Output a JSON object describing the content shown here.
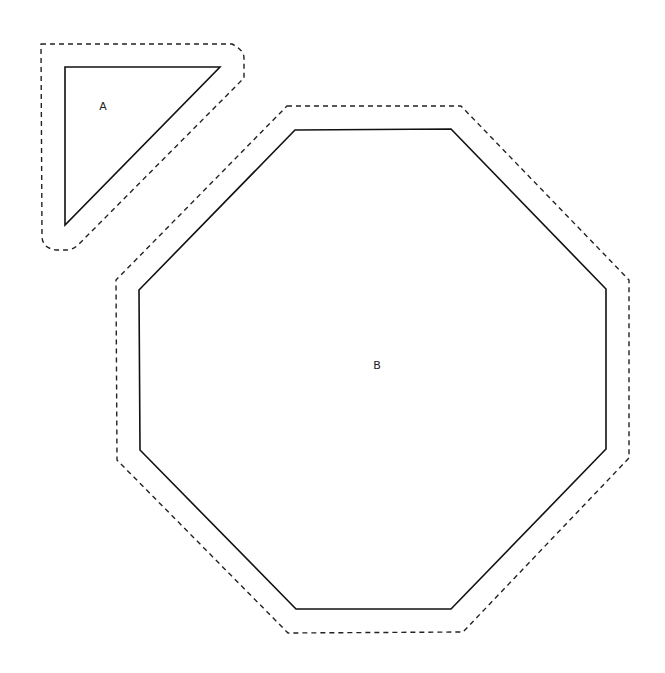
{
  "diagram": {
    "width": 665,
    "height": 673,
    "shapes": [
      {
        "id": "A",
        "label": "A",
        "type": "triangle",
        "label_pos": [
          103,
          106
        ],
        "points": "65,67 220,67 65,225",
        "offset_path": "M41,44 L232,44 Q244,50 244,58 L244,78 L80,243 Q74,250 66,250 L56,250 Q42,248 42,236 Z"
      },
      {
        "id": "B",
        "label": "B",
        "type": "octagon",
        "label_pos": [
          377,
          365
        ],
        "points": "295,130 451,129 606,289 606,449 451,609 296,609 140,450 139,290",
        "offset_path": "M287,106 L461,106 L629,280 L629,458 L463,632 L288,633 L117,460 L116,280 Z"
      }
    ],
    "stroke_color": "#111111",
    "background": "#ffffff"
  }
}
